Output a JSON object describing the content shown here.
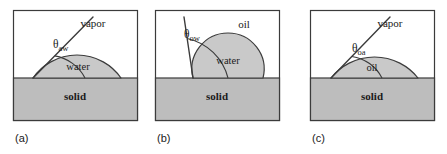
{
  "figure": {
    "type": "diagram",
    "background_color": "#ffffff",
    "fill_gray": "#bdbdbd",
    "droplet_gray": "#c9c9c9",
    "line_color": "#3b3b3b",
    "text_color": "#1a1a1a",
    "panels": [
      {
        "id": "a",
        "caption": "(a)",
        "box": {
          "x": 13,
          "y": 10,
          "width": 124,
          "height": 110
        },
        "interface_y": 78,
        "ambient_label": "vapor",
        "ambient_label_pos": {
          "x": 93,
          "y": 27
        },
        "droplet_label": "water",
        "droplet_label_pos": {
          "x": 78,
          "y": 70
        },
        "substrate_label": "solid",
        "substrate_label_pos": {
          "x": 75,
          "y": 100
        },
        "angle_label": "θ",
        "angle_subscript": "aw",
        "angle_label_pos": {
          "x": 53,
          "y": 48
        },
        "contact_point": {
          "x": 33,
          "y": 78
        },
        "droplet_right": {
          "x": 121,
          "y": 78
        },
        "droplet_apex": {
          "x": 85,
          "y": 55
        },
        "tangent_end": {
          "x": 93,
          "y": 17
        },
        "arc_radius": 31
      },
      {
        "id": "b",
        "caption": "(b)",
        "box": {
          "x": 155,
          "y": 10,
          "width": 124,
          "height": 110
        },
        "interface_y": 78,
        "ambient_label": "oil",
        "ambient_label_pos": {
          "x": 244,
          "y": 28
        },
        "droplet_label": "water",
        "droplet_label_pos": {
          "x": 228,
          "y": 64
        },
        "substrate_label": "solid",
        "substrate_label_pos": {
          "x": 217,
          "y": 100
        },
        "angle_label": "θ",
        "angle_subscript": "ow",
        "angle_label_pos": {
          "x": 184,
          "y": 38
        },
        "contact_point": {
          "x": 193,
          "y": 78
        },
        "droplet_right": {
          "x": 263,
          "y": 78
        },
        "droplet_apex": {
          "x": 228,
          "y": 33
        },
        "tangent_end": {
          "x": 184,
          "y": 17
        },
        "arc_radius": 40
      },
      {
        "id": "c",
        "caption": "(c)",
        "box": {
          "x": 310,
          "y": 10,
          "width": 124,
          "height": 110
        },
        "interface_y": 78,
        "ambient_label": "vapor",
        "ambient_label_pos": {
          "x": 390,
          "y": 27
        },
        "droplet_label": "oil",
        "droplet_label_pos": {
          "x": 372,
          "y": 71
        },
        "substrate_label": "solid",
        "substrate_label_pos": {
          "x": 372,
          "y": 100
        },
        "angle_label": "θ",
        "angle_subscript": "oa",
        "angle_label_pos": {
          "x": 352,
          "y": 52
        },
        "contact_point": {
          "x": 331,
          "y": 78
        },
        "droplet_right": {
          "x": 418,
          "y": 78
        },
        "droplet_apex": {
          "x": 382,
          "y": 57
        },
        "tangent_end": {
          "x": 390,
          "y": 17
        },
        "arc_radius": 30
      }
    ]
  }
}
